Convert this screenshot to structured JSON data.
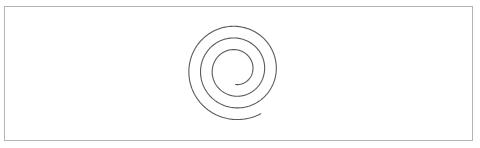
{
  "canvas": {
    "width": 480,
    "height": 148,
    "background_color": "#ffffff"
  },
  "frame": {
    "name": "image-border",
    "x": 4,
    "y": 6,
    "width": 468,
    "height": 134,
    "stroke_color": "#b3b3b3",
    "stroke_width": 1,
    "fill": "none"
  },
  "figure": {
    "name": "archimedean-spiral",
    "shape": "spiral",
    "stroke_color": "#5a5a5a",
    "stroke_width": 1.1,
    "fill": "none",
    "center_x": 235.5,
    "center_y": 70,
    "turns": 3,
    "turn_spacing_px": 12,
    "inner_radius": 14.5,
    "outer_radius": 50.5,
    "start_angle_deg": 90,
    "total_sweep_deg": 1110,
    "direction": "counter-clockwise",
    "inner_end_point": {
      "x": 238,
      "y": 88
    },
    "outer_end_point": {
      "x": 262,
      "y": 131
    },
    "bounding_box": {
      "left": 185,
      "top": 19,
      "right": 286,
      "bottom": 131
    },
    "radius_crossings": {
      "left_x": [
        185,
        197,
        209
      ],
      "right_x": [
        262,
        274,
        286
      ],
      "top_y": [
        19,
        32,
        45
      ],
      "bottom_y": [
        95,
        108,
        121
      ]
    }
  }
}
